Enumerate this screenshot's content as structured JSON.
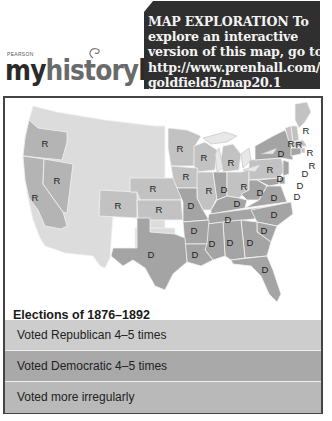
{
  "logo": {
    "publisher": "PEARSON",
    "brand_prefix": "my",
    "brand_name": "history",
    "brand_suffix": "lab"
  },
  "promo": {
    "lines": [
      "MAP EXPLORATION  To",
      "explore an interactive",
      "version of this map, go to",
      "http://www.prenhall.com/",
      "goldfield5/map20.1"
    ]
  },
  "colors": {
    "republican": "#cdcdcd",
    "democratic": "#a9a9a9",
    "irregular": "#dcdcdc",
    "promo_bg": "#2f2f2f"
  },
  "map": {
    "states": [
      {
        "name": "Oregon",
        "label": "R"
      },
      {
        "name": "California",
        "label": "R"
      },
      {
        "name": "Nevada",
        "label": "R"
      },
      {
        "name": "Colorado",
        "label": "R"
      },
      {
        "name": "Nebraska",
        "label": "R"
      },
      {
        "name": "Kansas",
        "label": "R"
      },
      {
        "name": "Minnesota",
        "label": "R"
      },
      {
        "name": "Wisconsin",
        "label": "R"
      },
      {
        "name": "Michigan",
        "label": "R"
      },
      {
        "name": "Iowa",
        "label": "R"
      },
      {
        "name": "Illinois",
        "label": "R"
      },
      {
        "name": "Indiana",
        "label": "D"
      },
      {
        "name": "Ohio",
        "label": "R"
      },
      {
        "name": "Pennsylvania",
        "label": "R"
      },
      {
        "name": "New York",
        "label": "D"
      },
      {
        "name": "Maine",
        "label": "R"
      },
      {
        "name": "Vermont",
        "label": "R"
      },
      {
        "name": "New Hampshire",
        "label": "R"
      },
      {
        "name": "Massachusetts",
        "label": "R"
      },
      {
        "name": "Rhode Island",
        "label": "R"
      },
      {
        "name": "Connecticut",
        "label": "D"
      },
      {
        "name": "New Jersey",
        "label": "D"
      },
      {
        "name": "Delaware",
        "label": "D"
      },
      {
        "name": "Maryland",
        "label": "D"
      },
      {
        "name": "West Virginia",
        "label": "D"
      },
      {
        "name": "Virginia",
        "label": "D"
      },
      {
        "name": "Kentucky",
        "label": "D"
      },
      {
        "name": "Missouri",
        "label": "D"
      },
      {
        "name": "Tennessee",
        "label": "D"
      },
      {
        "name": "North Carolina",
        "label": "D"
      },
      {
        "name": "South Carolina",
        "label": "D"
      },
      {
        "name": "Georgia",
        "label": "D"
      },
      {
        "name": "Alabama",
        "label": "D"
      },
      {
        "name": "Mississippi",
        "label": "D"
      },
      {
        "name": "Arkansas",
        "label": "D"
      },
      {
        "name": "Louisiana",
        "label": "D"
      },
      {
        "name": "Texas",
        "label": "D"
      },
      {
        "name": "Florida",
        "label": "D"
      }
    ]
  },
  "legend": {
    "title": "Elections of 1876–1892",
    "items": [
      {
        "label": "Voted Republican 4–5 times",
        "key": "republican"
      },
      {
        "label": "Voted Democratic 4–5 times",
        "key": "democratic"
      },
      {
        "label": "Voted more irregularly",
        "key": "irregular"
      }
    ]
  }
}
